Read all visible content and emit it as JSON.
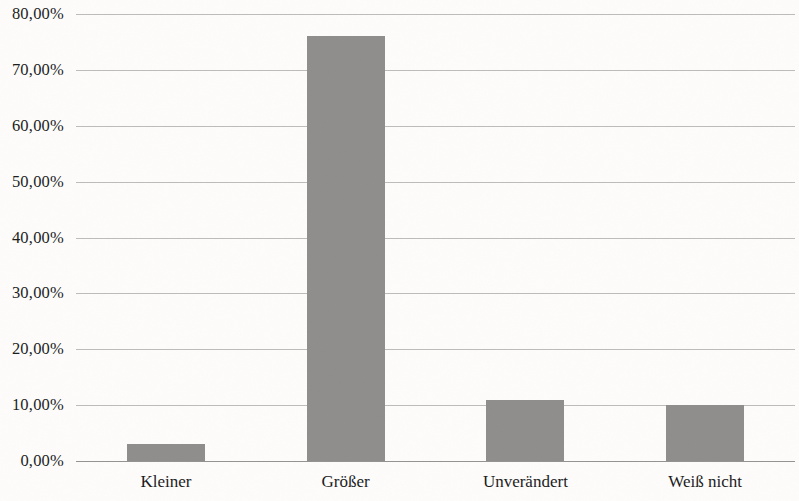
{
  "chart_data": {
    "type": "bar",
    "title": "",
    "subtitle": "",
    "xlabel": "",
    "ylabel": "",
    "categories": [
      "Kleiner",
      "Größer",
      "Unverändert",
      "Weiß nicht"
    ],
    "values": [
      3.0,
      76.0,
      11.0,
      10.0
    ],
    "value_labels": [
      "3,00%",
      "76,00%",
      "11,00%",
      "10,00%"
    ],
    "ylim": [
      0,
      80
    ],
    "ytick_values": [
      0,
      10,
      20,
      30,
      40,
      50,
      60,
      70,
      80
    ],
    "ytick_labels": [
      "0,00%",
      "10,00%",
      "20,00%",
      "30,00%",
      "40,00%",
      "50,00%",
      "60,00%",
      "70,00%",
      "80,00%"
    ],
    "grid": true,
    "grid_axis": "y",
    "legend": false,
    "legend_position": "none",
    "bar_color": "#8f8e8c",
    "gridline_color": "#b9b8b6",
    "axis_color": "#8e8d8b",
    "background_color": "#fdfcfb",
    "text_color": "#1c1c1c",
    "series": [
      {
        "name": "Anteil",
        "values": [
          3.0,
          76.0,
          11.0,
          10.0
        ]
      }
    ]
  }
}
